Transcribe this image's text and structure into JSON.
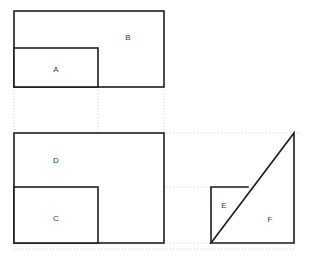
{
  "figure": {
    "title": "",
    "background_color": "#ffffff",
    "stroke_color": "#1c1c1c",
    "guide_color": "#c9c9c9",
    "label_color": "#3a3a3a",
    "shapes": [
      {
        "id": "B",
        "label": "B",
        "type": "rectangle",
        "x": 14,
        "y": 11,
        "width": 150,
        "height": 76,
        "label_x": 128,
        "label_y": 38
      },
      {
        "id": "A",
        "label": "A",
        "type": "rectangle",
        "x": 14,
        "y": 48,
        "width": 84,
        "height": 39,
        "label_x": 56,
        "label_y": 70
      },
      {
        "id": "D",
        "label": "D",
        "type": "rectangle",
        "x": 14,
        "y": 133,
        "width": 150,
        "height": 110,
        "label_x": 56,
        "label_y": 161
      },
      {
        "id": "C",
        "label": "C",
        "type": "rectangle",
        "x": 14,
        "y": 187,
        "width": 84,
        "height": 56,
        "label_x": 56,
        "label_y": 219
      },
      {
        "id": "E",
        "label": "E",
        "type": "square",
        "x": 211,
        "y": 187,
        "width": 37,
        "height": 56,
        "label_x": 224,
        "label_y": 206
      },
      {
        "id": "F",
        "label": "F",
        "type": "triangle",
        "points": "211,243 294,243 294,133",
        "label_x": 270,
        "label_y": 220
      }
    ],
    "guides": [
      {
        "name": "guide-vertical-left",
        "x1": 14,
        "y1": 87,
        "x2": 14,
        "y2": 133
      },
      {
        "name": "guide-vertical-mid",
        "x1": 98,
        "y1": 87,
        "x2": 98,
        "y2": 133
      },
      {
        "name": "guide-vertical-right",
        "x1": 164,
        "y1": 87,
        "x2": 164,
        "y2": 133
      },
      {
        "name": "guide-horizontal-top",
        "x1": 164,
        "y1": 133,
        "x2": 302,
        "y2": 133
      },
      {
        "name": "guide-horizontal-mid-left",
        "x1": 98,
        "y1": 187,
        "x2": 164,
        "y2": 187
      },
      {
        "name": "guide-horizontal-mid-right",
        "x1": 164,
        "y1": 187,
        "x2": 211,
        "y2": 187
      },
      {
        "name": "guide-horizontal-bottom",
        "x1": 164,
        "y1": 243,
        "x2": 211,
        "y2": 243
      },
      {
        "name": "guide-horizontal-below",
        "x1": 14,
        "y1": 249,
        "x2": 294,
        "y2": 249
      }
    ]
  }
}
